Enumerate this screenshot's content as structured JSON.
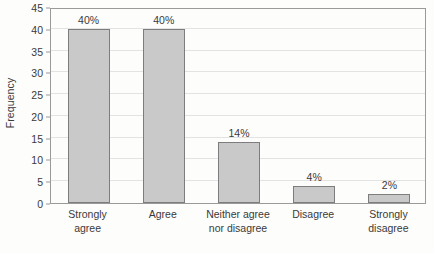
{
  "chart_data": {
    "type": "bar",
    "title": "",
    "xlabel": "",
    "ylabel": "Frequency",
    "categories": [
      "Strongly agree",
      "Agree",
      "Neither agree nor disagree",
      "Disagree",
      "Strongly disagree"
    ],
    "category_lines": [
      [
        "Strongly",
        "agree"
      ],
      [
        "Agree"
      ],
      [
        "Neither agree",
        "nor disagree"
      ],
      [
        "Disagree"
      ],
      [
        "Strongly",
        "disagree"
      ]
    ],
    "values": [
      40,
      40,
      14,
      4,
      2
    ],
    "data_labels": [
      "40%",
      "40%",
      "14%",
      "4%",
      "2%"
    ],
    "ylim": [
      0,
      45
    ],
    "ytick_step": 5,
    "yticks": [
      0,
      5,
      10,
      15,
      20,
      25,
      30,
      35,
      40,
      45
    ],
    "ytick_labels": [
      "0",
      "5",
      "10",
      "15",
      "20",
      "25",
      "30",
      "35",
      "40",
      "45"
    ],
    "grid": true,
    "grid_axis": "y",
    "legend": false,
    "legend_position": "none",
    "bar_fill_color": "#c9c9c9",
    "bar_edge_color": "#7d7d7d",
    "gridline_color": "#e3e3e3",
    "axis_color": "#9a9a9a",
    "text_color": "#3a3a3a",
    "background_color": "#fdfdfc"
  }
}
